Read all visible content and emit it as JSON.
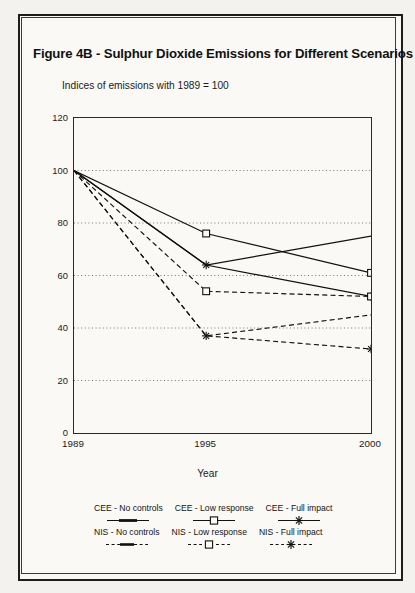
{
  "figure": {
    "title": "Figure 4B - Sulphur Dioxide Emissions for Different Scenarios",
    "subtitle": "Indices of emissions with 1989 = 100"
  },
  "chart_data": {
    "type": "line",
    "title": "Figure 4B - Sulphur Dioxide Emissions for Different Scenarios",
    "subtitle": "Indices of emissions with 1989 = 100",
    "xlabel": "Year",
    "ylabel": "",
    "categories": [
      "1989",
      "1995",
      "2000"
    ],
    "x": [
      1989,
      1995,
      2000
    ],
    "ylim": [
      0,
      120
    ],
    "yticks": [
      0,
      20,
      40,
      60,
      80,
      100,
      120
    ],
    "xticks": [
      "1989",
      "1995",
      "2000"
    ],
    "grid": "horizontal-dotted",
    "legend_position": "bottom",
    "series": [
      {
        "name": "CEE - No controls",
        "values": [
          100,
          64,
          75
        ],
        "line": "solid",
        "marker": "none",
        "color": "#111111"
      },
      {
        "name": "CEE - Low response",
        "values": [
          100,
          76,
          61
        ],
        "line": "solid",
        "marker": "square",
        "color": "#111111"
      },
      {
        "name": "CEE - Full impact",
        "values": [
          100,
          64,
          52
        ],
        "line": "solid",
        "marker": "star",
        "color": "#111111"
      },
      {
        "name": "NIS - No controls",
        "values": [
          100,
          37,
          45
        ],
        "line": "dashed",
        "marker": "none",
        "color": "#111111"
      },
      {
        "name": "NIS - Low response",
        "values": [
          100,
          54,
          52
        ],
        "line": "dashed",
        "marker": "square",
        "color": "#111111"
      },
      {
        "name": "NIS - Full impact",
        "values": [
          100,
          37,
          32
        ],
        "line": "dashed",
        "marker": "star",
        "color": "#111111"
      }
    ]
  }
}
